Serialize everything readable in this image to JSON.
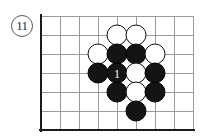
{
  "diagram": {
    "problem_number": "11",
    "board": {
      "grid": {
        "cols": 9,
        "rows": 7,
        "spacing": 19,
        "origin_x": 5,
        "origin_y": 6,
        "line_color": "#9a9a9a",
        "edge_color": "#1a1a1a",
        "edges": [
          "left",
          "bottom"
        ]
      },
      "stone_colors": {
        "black": "#141414",
        "white": "#ffffff",
        "outline": "#101010"
      },
      "stones": [
        {
          "id": "w-c6r1",
          "color": "white",
          "col": 4,
          "row": 1,
          "label": ""
        },
        {
          "id": "w-c7r1",
          "color": "white",
          "col": 5,
          "row": 1,
          "label": ""
        },
        {
          "id": "w-c5r2",
          "color": "white",
          "col": 3,
          "row": 2,
          "label": ""
        },
        {
          "id": "b-c6r2",
          "color": "black",
          "col": 4,
          "row": 2,
          "label": ""
        },
        {
          "id": "b-c7r2",
          "color": "black",
          "col": 5,
          "row": 2,
          "label": ""
        },
        {
          "id": "w-c8r2",
          "color": "white",
          "col": 6,
          "row": 2,
          "label": ""
        },
        {
          "id": "b-c5r3",
          "color": "black",
          "col": 3,
          "row": 3,
          "label": ""
        },
        {
          "id": "b-c6r3",
          "color": "black",
          "col": 4,
          "row": 3,
          "label": "1"
        },
        {
          "id": "w-c7r3",
          "color": "white",
          "col": 5,
          "row": 3,
          "label": ""
        },
        {
          "id": "b-c8r3",
          "color": "black",
          "col": 6,
          "row": 3,
          "label": ""
        },
        {
          "id": "b-c6r4",
          "color": "black",
          "col": 4,
          "row": 4,
          "label": ""
        },
        {
          "id": "w-c7r4",
          "color": "white",
          "col": 5,
          "row": 4,
          "label": ""
        },
        {
          "id": "b-c8r4",
          "color": "black",
          "col": 6,
          "row": 4,
          "label": ""
        },
        {
          "id": "b-c7r5",
          "color": "black",
          "col": 5,
          "row": 5,
          "label": ""
        }
      ]
    }
  }
}
